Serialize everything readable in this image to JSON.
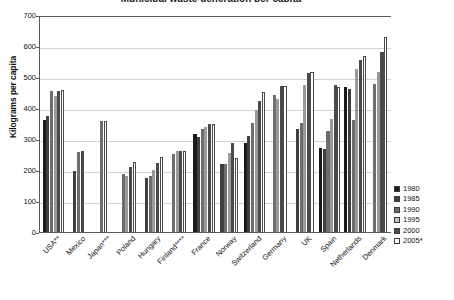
{
  "chart_data": {
    "type": "bar",
    "title": "Municipal waste generation per capita",
    "xlabel": "",
    "ylabel": "Kilograms per capita",
    "ylim": [
      0,
      700
    ],
    "yticks": [
      0,
      100,
      200,
      300,
      400,
      500,
      600,
      700
    ],
    "grid": true,
    "legend_position": "bottom-right",
    "categories": [
      "USA**",
      "Mexico",
      "Japan***",
      "Poland",
      "Hungary",
      "Finland****",
      "France",
      "Norway",
      "Switzerland",
      "Germany",
      "UK",
      "Spain",
      "Netherlands",
      "Denmark"
    ],
    "series": [
      {
        "name": "1980",
        "color": "#1a1a1a",
        "values": [
          363,
          null,
          null,
          null,
          null,
          null,
          320,
          null,
          289,
          null,
          null,
          275,
          470,
          null
        ]
      },
      {
        "name": "1985",
        "color": "#3f3f3f",
        "values": [
          377,
          200,
          null,
          null,
          179,
          null,
          311,
          223,
          312,
          null,
          337,
          271,
          465,
          null
        ]
      },
      {
        "name": "1990",
        "color": "#6d6d6d",
        "values": [
          458,
          262,
          362,
          190,
          183,
          255,
          336,
          222,
          356,
          444,
          355,
          330,
          365,
          480
        ]
      },
      {
        "name": "1995",
        "color": "#9a9a9a",
        "values": [
          442,
          null,
          null,
          183,
          204,
          266,
          343,
          258,
          398,
          432,
          479,
          369,
          530,
          521
        ]
      },
      {
        "name": "2000",
        "color": "#4a4a4a",
        "values": [
          458,
          266,
          null,
          214,
          227,
          265,
          351,
          290,
          426,
          475,
          516,
          478,
          558,
          584
        ]
      },
      {
        "name": "2005*",
        "color": "#ffffff",
        "values": [
          462,
          null,
          360,
          228,
          245,
          264,
          352,
          242,
          456,
          475,
          520,
          471,
          570,
          632
        ]
      }
    ],
    "notes": [
      "* 2005",
      "** USA",
      "*** Japan",
      "**** Finland"
    ]
  },
  "legend": {
    "items": [
      {
        "label": "1980",
        "color": "#1a1a1a"
      },
      {
        "label": "1985",
        "color": "#3f3f3f"
      },
      {
        "label": "1990",
        "color": "#6d6d6d"
      },
      {
        "label": "1995",
        "color": "#c2c2c2"
      },
      {
        "label": "2000",
        "color": "#4a4a4a"
      },
      {
        "label": "2005*",
        "color": "#ffffff"
      }
    ]
  },
  "axis": {
    "y_labels": [
      "700",
      "600",
      "500",
      "400",
      "300",
      "200",
      "100",
      "0"
    ],
    "y_title": "Kilograms per capita"
  }
}
